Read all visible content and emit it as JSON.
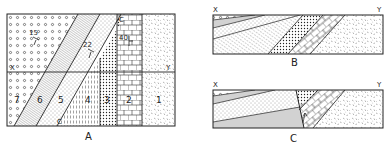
{
  "figure": {
    "panels": [
      {
        "id": "A",
        "caption": "A",
        "view": "map",
        "section_line": {
          "start": "X",
          "end": "Y"
        },
        "units": [
          {
            "number": "1",
            "pattern": "random-dashes"
          },
          {
            "number": "2",
            "pattern": "brick"
          },
          {
            "number": "3",
            "pattern": "dense-dots"
          },
          {
            "number": "4",
            "pattern": "vertical-dashes"
          },
          {
            "number": "5",
            "pattern": "fine-dots"
          },
          {
            "number": "6",
            "pattern": "fine-lines"
          },
          {
            "number": "7",
            "pattern": "circles"
          }
        ],
        "dips": [
          {
            "value": "15"
          },
          {
            "value": "22"
          },
          {
            "value": "40"
          }
        ],
        "contact_line_labels": [
          "C",
          "C"
        ]
      },
      {
        "id": "B",
        "caption": "B",
        "view": "cross-section",
        "ends": {
          "left": "X",
          "right": "Y"
        }
      },
      {
        "id": "C",
        "caption": "C",
        "view": "cross-section",
        "ends": {
          "left": "X",
          "right": "Y"
        }
      }
    ]
  },
  "colors": {
    "ink": "#222222",
    "background": "#ffffff"
  }
}
